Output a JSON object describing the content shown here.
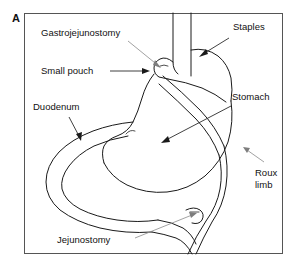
{
  "figure": {
    "panel_letter": "A",
    "border_color": "#555555",
    "background_color": "#ffffff",
    "ink_color": "#1a1a1a",
    "leader_color": "#2b2b2b",
    "faint_leader_color": "#8a8a8a"
  },
  "labels": {
    "gastrojejunostomy": "Gastrojejunostomy",
    "staples": "Staples",
    "small_pouch": "Small pouch",
    "stomach": "Stomach",
    "duodenum": "Duodenum",
    "roux_limb_line1": "Roux",
    "roux_limb_line2": "limb",
    "jejunostomy": "Jejunostomy"
  },
  "structures": [
    {
      "name": "esophagus",
      "description": "vertical tube entering from top border"
    },
    {
      "name": "small-gastric-pouch",
      "description": "small proximal pouch at esophagogastric junction"
    },
    {
      "name": "stomach-body",
      "description": "bypassed distal stomach"
    },
    {
      "name": "duodenum",
      "description": "C-shaped duodenal loop on the left"
    },
    {
      "name": "roux-limb",
      "description": "jejunal limb crossing down to the right and exiting bottom"
    },
    {
      "name": "jejunostomy-tube",
      "description": "feeding tube stub at lower jejunum"
    },
    {
      "name": "staple-line",
      "description": "staple line across upper stomach"
    }
  ]
}
